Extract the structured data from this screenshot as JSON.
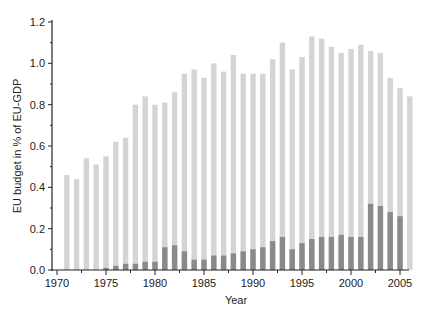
{
  "chart_data": {
    "type": "bar",
    "title": "",
    "xlabel": "Year",
    "ylabel": "EU budget in % of EU-GDP",
    "ylim": [
      0,
      1.2
    ],
    "xlim": [
      1970,
      2006
    ],
    "grid": false,
    "legend": null,
    "x_ticks": [
      "1970",
      "1975",
      "1980",
      "1985",
      "1990",
      "1995",
      "2000",
      "2005"
    ],
    "y_ticks": [
      "0.0",
      "0.2",
      "0.4",
      "0.6",
      "0.8",
      "1.0",
      "1.2"
    ],
    "series": [
      {
        "name": "light-series",
        "color": "#d4d4d4",
        "x": [
          1971,
          1972,
          1973,
          1974,
          1975,
          1976,
          1977,
          1978,
          1979,
          1980,
          1981,
          1982,
          1983,
          1984,
          1985,
          1986,
          1987,
          1988,
          1989,
          1990,
          1991,
          1992,
          1993,
          1994,
          1995,
          1996,
          1997,
          1998,
          1999,
          2000,
          2001,
          2002,
          2003,
          2004,
          2005,
          2006
        ],
        "values": [
          0.46,
          0.44,
          0.54,
          0.51,
          0.55,
          0.62,
          0.64,
          0.8,
          0.84,
          0.8,
          0.81,
          0.86,
          0.95,
          0.97,
          0.93,
          1.0,
          0.96,
          1.04,
          0.95,
          0.95,
          0.95,
          1.02,
          1.1,
          0.97,
          1.03,
          1.13,
          1.12,
          1.08,
          1.05,
          1.07,
          1.09,
          1.06,
          1.05,
          0.93,
          0.88,
          0.84
        ]
      },
      {
        "name": "dark-series",
        "color": "#8a8a8a",
        "x": [
          1975,
          1976,
          1977,
          1978,
          1979,
          1980,
          1981,
          1982,
          1983,
          1984,
          1985,
          1986,
          1987,
          1988,
          1989,
          1990,
          1991,
          1992,
          1993,
          1994,
          1995,
          1996,
          1997,
          1998,
          1999,
          2000,
          2001,
          2002,
          2003,
          2004,
          2005
        ],
        "values": [
          0.01,
          0.02,
          0.03,
          0.03,
          0.04,
          0.04,
          0.11,
          0.12,
          0.09,
          0.05,
          0.05,
          0.07,
          0.07,
          0.08,
          0.09,
          0.1,
          0.11,
          0.14,
          0.16,
          0.1,
          0.13,
          0.15,
          0.16,
          0.16,
          0.17,
          0.16,
          0.16,
          0.32,
          0.31,
          0.28,
          0.26
        ]
      }
    ]
  }
}
